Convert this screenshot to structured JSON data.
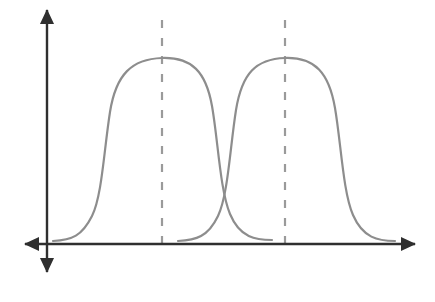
{
  "figure": {
    "title": "",
    "background_color": "#ffffff",
    "width": 435,
    "height": 302
  },
  "axes": {
    "color": "#2f2f2f",
    "stroke_width": 2.4,
    "origin": {
      "x": 47,
      "y": 244
    },
    "x_axis": {
      "name": "x-axis",
      "from_x": 25,
      "to_x": 415,
      "y": 244,
      "arrow_left": true,
      "arrow_right": true
    },
    "y_axis": {
      "name": "y-axis",
      "from_y": 10,
      "to_y": 272,
      "x": 47,
      "arrow_up": true,
      "arrow_down": true
    }
  },
  "guides": {
    "color": "#9a9a9a",
    "stroke_width": 2.2,
    "dash": "8 10",
    "lines": [
      {
        "label": "mean-line-1",
        "x": 162,
        "y_top": 20,
        "y_bottom": 253
      },
      {
        "label": "mean-line-2",
        "x": 285,
        "y_top": 20,
        "y_bottom": 253
      }
    ]
  },
  "chart_data": {
    "type": "line",
    "title": "",
    "xlabel": "",
    "ylabel": "",
    "grid": false,
    "legend": "none",
    "axis_style": "arrows-both-directions",
    "baseline_y": 244,
    "peak_y": 58,
    "crossing_point": {
      "x": 226,
      "y": 165
    },
    "annotations": [
      {
        "type": "vertical-dashed-line",
        "x": 162,
        "meaning": "center of first distribution"
      },
      {
        "type": "vertical-dashed-line",
        "x": 285,
        "meaning": "center of second distribution"
      }
    ],
    "series": [
      {
        "name": "curve-1",
        "color": "#8d8d8d",
        "stroke_width": 2.2,
        "center_x": 162,
        "x_start": 53,
        "x_end": 272,
        "peak_y": 58,
        "baseline_y": 240,
        "path": "M53,241 C72,240 82,236 92,216 C102,196 104,150 110,112 C116,74 132,59 162,58 C192,57 206,72 212,106 C218,140 220,190 230,214 C240,238 256,240 272,240"
      },
      {
        "name": "curve-2",
        "color": "#8d8d8d",
        "stroke_width": 2.2,
        "center_x": 285,
        "x_start": 178,
        "x_end": 395,
        "peak_y": 58,
        "baseline_y": 240,
        "path": "M178,241 C196,240 208,237 218,216 C228,195 230,148 236,110 C242,73 256,59 285,58 C315,57 329,73 335,108 C341,143 343,192 353,215 C363,238 378,241 395,241"
      }
    ]
  }
}
